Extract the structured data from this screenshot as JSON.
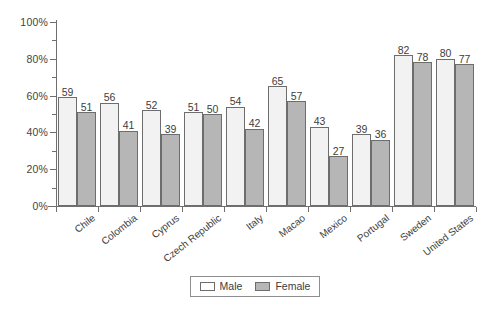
{
  "chart_data": {
    "type": "bar",
    "title": "",
    "subtitle": "",
    "xlabel": "",
    "ylabel": "",
    "ylim": [
      0,
      100
    ],
    "y_ticks": [
      "0%",
      "20%",
      "40%",
      "60%",
      "80%",
      "100%"
    ],
    "y_tick_values": [
      0,
      20,
      40,
      60,
      80,
      100
    ],
    "y_minor_tick_values": [
      10,
      30,
      50,
      70,
      90
    ],
    "grid": false,
    "legend_position": "bottom-center",
    "categories": [
      "Chile",
      "Colombia",
      "Cyprus",
      "Czech Republic",
      "Italy",
      "Macao",
      "Mexico",
      "Portugal",
      "Sweden",
      "United States"
    ],
    "series": [
      {
        "name": "Male",
        "color": "#f2f2f2",
        "values": [
          59,
          56,
          52,
          51,
          54,
          65,
          43,
          39,
          82,
          80
        ]
      },
      {
        "name": "Female",
        "color": "#b6b6b6",
        "values": [
          51,
          41,
          39,
          50,
          42,
          57,
          27,
          36,
          78,
          77
        ]
      }
    ]
  },
  "legend": {
    "entries": [
      {
        "label": "Male",
        "swatch": "male"
      },
      {
        "label": "Female",
        "swatch": "female"
      }
    ]
  },
  "colors": {
    "male_fill": "#f2f2f2",
    "female_fill": "#b6b6b6",
    "axis": "#6f6f6f",
    "text": "#3d3d3d",
    "background": "#ffffff"
  }
}
